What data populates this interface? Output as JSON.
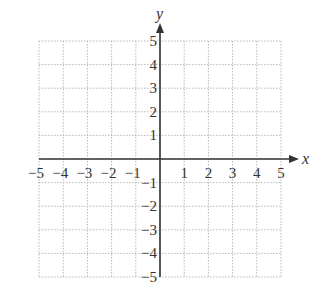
{
  "chart_data": {
    "type": "scatter",
    "title": "",
    "xlabel": "x",
    "ylabel": "y",
    "xlim": [
      -5,
      5
    ],
    "ylim": [
      -5,
      5
    ],
    "grid": true,
    "grid_style": "dotted",
    "x_ticks": [
      -5,
      -4,
      -3,
      -2,
      -1,
      1,
      2,
      3,
      4,
      5
    ],
    "y_ticks": [
      -5,
      -4,
      -3,
      -2,
      -1,
      1,
      2,
      3,
      4,
      5
    ],
    "x_tick_labels": [
      "−5",
      "−4",
      "−3",
      "−2",
      "−1",
      "1",
      "2",
      "3",
      "4",
      "5"
    ],
    "y_tick_labels": [
      "−5",
      "−4",
      "−3",
      "−2",
      "−1",
      "1",
      "2",
      "3",
      "4",
      "5"
    ],
    "series": [],
    "legend": null
  },
  "colors": {
    "axis": "#333333",
    "grid": "#b8b8b8",
    "text": "#333333"
  },
  "layout": {
    "left": 39,
    "right": 281,
    "top": 41,
    "bottom": 277,
    "origin_x": 159,
    "origin_y": 158
  }
}
